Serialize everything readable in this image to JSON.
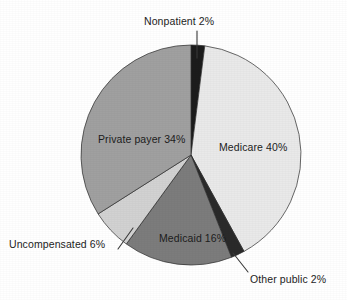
{
  "chart_data": {
    "type": "pie",
    "title": "",
    "subtitle": "",
    "xlabel": "",
    "ylabel": "",
    "legend_position": "none",
    "grid": false,
    "units": "percent",
    "total": 100,
    "start_angle_deg": 0,
    "direction": "clockwise",
    "categories": [
      "Nonpatient",
      "Medicare",
      "Other public",
      "Medicaid",
      "Uncompensated",
      "Private payer"
    ],
    "values": [
      2,
      40,
      2,
      16,
      6,
      34
    ],
    "slices": [
      {
        "label": "Nonpatient 2%",
        "name": "Nonpatient",
        "value": 2,
        "color": "#1c1c1c",
        "label_placement": "outside",
        "has_leader_line": true
      },
      {
        "label": "Medicare 40%",
        "name": "Medicare",
        "value": 40,
        "color": "#e9e9e9",
        "label_placement": "inside",
        "has_leader_line": false
      },
      {
        "label": "Other public 2%",
        "name": "Other public",
        "value": 2,
        "color": "#2a2a2a",
        "label_placement": "outside",
        "has_leader_line": true
      },
      {
        "label": "Medicaid 16%",
        "name": "Medicaid",
        "value": 16,
        "color": "#7c7c7c",
        "label_placement": "inside",
        "has_leader_line": false
      },
      {
        "label": "Uncompensated 6%",
        "name": "Uncompensated",
        "value": 6,
        "color": "#d2d2d2",
        "label_placement": "outside",
        "has_leader_line": true
      },
      {
        "label": "Private payer 34%",
        "name": "Private payer",
        "value": 34,
        "color": "#a0a0a0",
        "label_placement": "inside",
        "has_leader_line": false
      }
    ]
  },
  "colors": {
    "background": "#ffffff",
    "text": "#1d1d1d",
    "outline": "#2b2b2b",
    "leader_line": "#3a3a3a"
  }
}
